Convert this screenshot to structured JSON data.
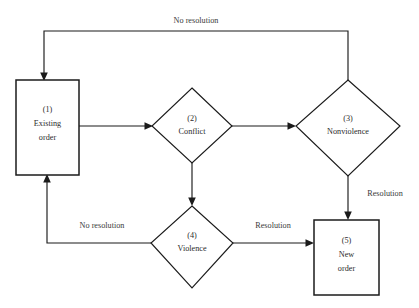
{
  "diagram": {
    "background_color": "#ffffff",
    "stroke_color": "#1b1b1b",
    "text_color": "#2b2b2b",
    "nodes": [
      {
        "id": "n1",
        "shape": "rectangle",
        "number": "(1)",
        "line1": "Existing",
        "line2": "order"
      },
      {
        "id": "n2",
        "shape": "diamond",
        "number": "(2)",
        "line1": "Conflict",
        "line2": ""
      },
      {
        "id": "n3",
        "shape": "diamond",
        "number": "(3)",
        "line1": "Nonviolence",
        "line2": ""
      },
      {
        "id": "n4",
        "shape": "diamond",
        "number": "(4)",
        "line1": "Violence",
        "line2": ""
      },
      {
        "id": "n5",
        "shape": "rectangle",
        "number": "(5)",
        "line1": "New",
        "line2": "order"
      }
    ],
    "edges": [
      {
        "id": "e_top_return",
        "from": "n3",
        "to": "n1",
        "label": "No resolution"
      },
      {
        "id": "e_1_2",
        "from": "n1",
        "to": "n2",
        "label": ""
      },
      {
        "id": "e_2_3",
        "from": "n2",
        "to": "n3",
        "label": ""
      },
      {
        "id": "e_2_4",
        "from": "n2",
        "to": "n4",
        "label": ""
      },
      {
        "id": "e_3_5",
        "from": "n3",
        "to": "n5",
        "label": "Resolution"
      },
      {
        "id": "e_4_5",
        "from": "n4",
        "to": "n5",
        "label": "Resolution"
      },
      {
        "id": "e_4_1",
        "from": "n4",
        "to": "n1",
        "label": "No resolution"
      }
    ]
  }
}
